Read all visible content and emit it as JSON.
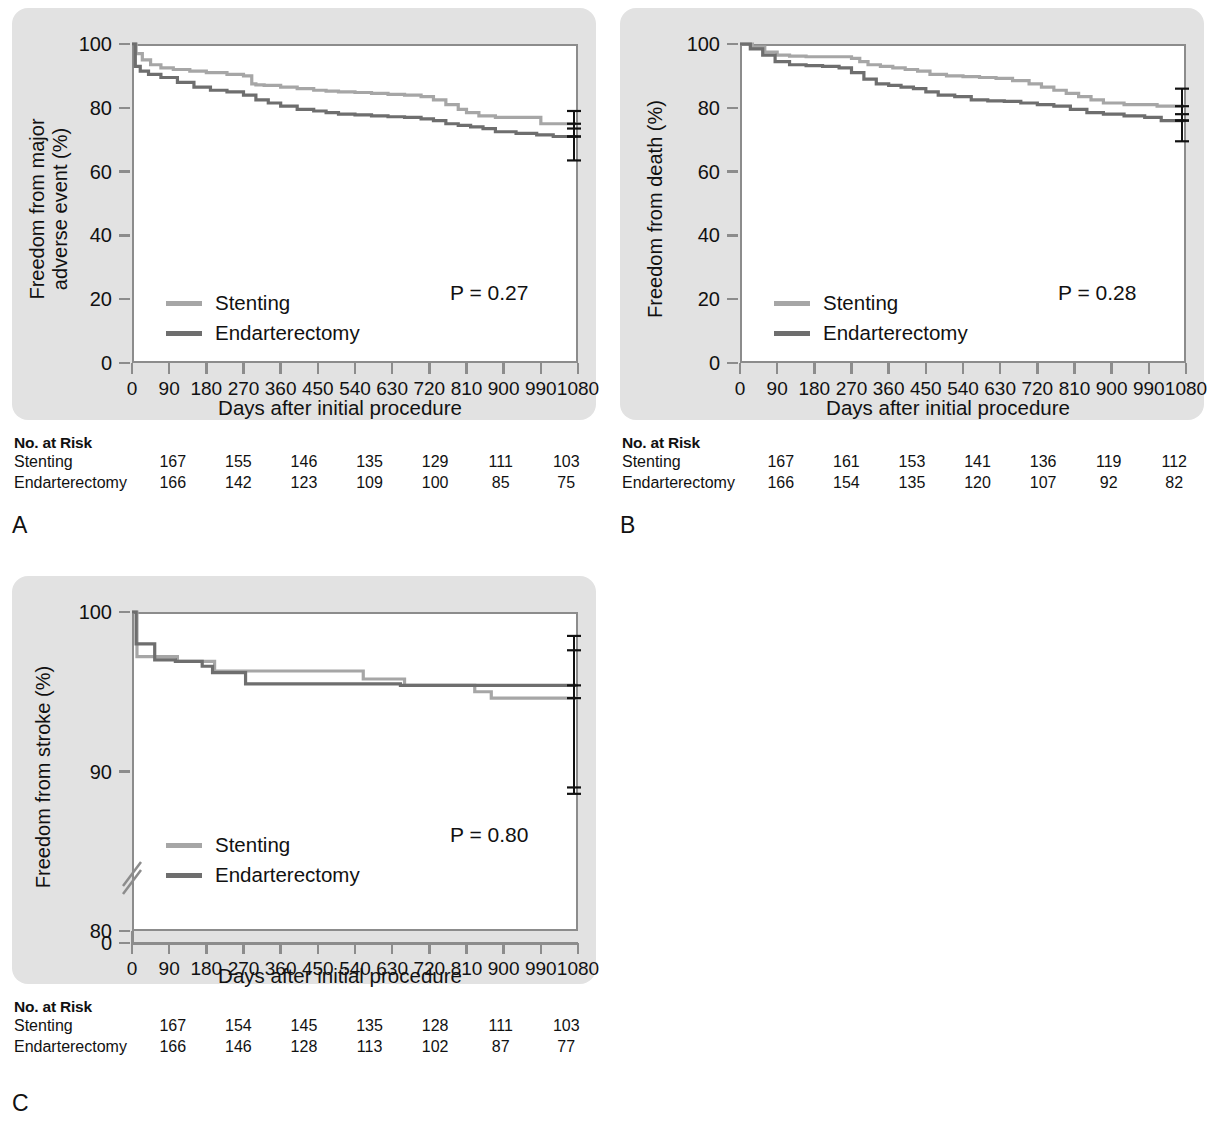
{
  "figure": {
    "style": {
      "plate_background": "#e2e2e2",
      "plot_background": "#ffffff",
      "axis_color": "#8c8c8c",
      "text_color": "#111111",
      "stenting_color": "#a6a6a6",
      "endarterectomy_color": "#6e6e6e",
      "errorbar_color": "#111111"
    },
    "panels": [
      {
        "id": "A",
        "letter": "A",
        "pvalue": "P = 0.27",
        "ylabel_line1": "Freedom from major",
        "ylabel_line2": "adverse event (%)",
        "xlabel": "Days after initial procedure",
        "legend": [
          {
            "label": "Stenting",
            "color": "#a6a6a6"
          },
          {
            "label": "Endarterectomy",
            "color": "#6e6e6e"
          }
        ],
        "yticks": [
          "0",
          "20",
          "40",
          "60",
          "80",
          "100"
        ],
        "xticks": [
          "0",
          "90",
          "180",
          "270",
          "360",
          "450",
          "540",
          "630",
          "720",
          "810",
          "900",
          "990",
          "1080"
        ],
        "risk": {
          "title": "No. at Risk",
          "rows": [
            {
              "name": "Stenting",
              "values": [
                "167",
                "155",
                "146",
                "135",
                "129",
                "111",
                "103"
              ]
            },
            {
              "name": "Endarterectomy",
              "values": [
                "166",
                "142",
                "123",
                "109",
                "100",
                "85",
                "75"
              ]
            }
          ]
        }
      },
      {
        "id": "B",
        "letter": "B",
        "pvalue": "P = 0.28",
        "ylabel_line1": "Freedom from death (%)",
        "ylabel_line2": "",
        "xlabel": "Days after initial procedure",
        "legend": [
          {
            "label": "Stenting",
            "color": "#a6a6a6"
          },
          {
            "label": "Endarterectomy",
            "color": "#6e6e6e"
          }
        ],
        "yticks": [
          "0",
          "20",
          "40",
          "60",
          "80",
          "100"
        ],
        "xticks": [
          "0",
          "90",
          "180",
          "270",
          "360",
          "450",
          "540",
          "630",
          "720",
          "810",
          "900",
          "990",
          "1080"
        ],
        "risk": {
          "title": "No. at Risk",
          "rows": [
            {
              "name": "Stenting",
              "values": [
                "167",
                "161",
                "153",
                "141",
                "136",
                "119",
                "112"
              ]
            },
            {
              "name": "Endarterectomy",
              "values": [
                "166",
                "154",
                "135",
                "120",
                "107",
                "92",
                "82"
              ]
            }
          ]
        }
      },
      {
        "id": "C",
        "letter": "C",
        "pvalue": "P = 0.80",
        "ylabel_line1": "Freedom from stroke (%)",
        "ylabel_line2": "",
        "xlabel": "Days after initial procedure",
        "legend": [
          {
            "label": "Stenting",
            "color": "#a6a6a6"
          },
          {
            "label": "Endarterectomy",
            "color": "#6e6e6e"
          }
        ],
        "yticks": [
          "0",
          "80",
          "90",
          "100"
        ],
        "xticks": [
          "0",
          "90",
          "180",
          "270",
          "360",
          "450",
          "540",
          "630",
          "720",
          "810",
          "900",
          "990",
          "1080"
        ],
        "axis_break": true,
        "risk": {
          "title": "No. at Risk",
          "rows": [
            {
              "name": "Stenting",
              "values": [
                "167",
                "154",
                "145",
                "135",
                "128",
                "111",
                "103"
              ]
            },
            {
              "name": "Endarterectomy",
              "values": [
                "166",
                "146",
                "128",
                "113",
                "102",
                "87",
                "77"
              ]
            }
          ]
        }
      }
    ]
  },
  "chart_data": [
    {
      "type": "line",
      "panel": "A",
      "title": "Freedom from major adverse event",
      "xlabel": "Days after initial procedure",
      "ylabel": "Freedom from major adverse event (%)",
      "xlim": [
        0,
        1080
      ],
      "ylim": [
        0,
        100
      ],
      "xticks": [
        0,
        90,
        180,
        270,
        360,
        450,
        540,
        630,
        720,
        810,
        900,
        990,
        1080
      ],
      "yticks": [
        0,
        20,
        40,
        60,
        80,
        100
      ],
      "grid": false,
      "legend_position": "lower-left",
      "annotations": [
        "P = 0.27"
      ],
      "pvalue": 0.27,
      "series": [
        {
          "name": "Stenting",
          "color": "#a6a6a6",
          "step": true,
          "x": [
            0,
            10,
            25,
            45,
            70,
            100,
            140,
            180,
            230,
            270,
            290,
            300,
            320,
            360,
            400,
            440,
            470,
            500,
            540,
            580,
            620,
            660,
            700,
            730,
            760,
            790,
            810,
            840,
            880,
            930,
            975,
            990,
            1020,
            1080
          ],
          "y": [
            100,
            97,
            95,
            93.5,
            92.5,
            92,
            91.5,
            91,
            90.5,
            90,
            87.5,
            87.2,
            87,
            86.5,
            86,
            85.5,
            85.2,
            85,
            84.8,
            84.5,
            84.2,
            84,
            83.5,
            82.5,
            81,
            79.5,
            78.5,
            77.5,
            77,
            77,
            77,
            75,
            75,
            75
          ]
        },
        {
          "name": "Endarterectomy",
          "color": "#6e6e6e",
          "step": true,
          "x": [
            0,
            8,
            20,
            40,
            70,
            110,
            150,
            190,
            230,
            270,
            300,
            330,
            360,
            400,
            440,
            470,
            500,
            540,
            580,
            620,
            660,
            700,
            730,
            760,
            790,
            820,
            850,
            880,
            930,
            980,
            1020,
            1080
          ],
          "y": [
            100,
            93,
            91.5,
            90.5,
            89.5,
            88,
            86.5,
            85.5,
            85,
            84,
            82.5,
            81.5,
            80.5,
            79.5,
            79,
            78.5,
            78,
            77.8,
            77.5,
            77.2,
            77,
            76.5,
            76,
            75,
            74.5,
            74,
            73.5,
            72.5,
            72,
            71.5,
            71,
            71
          ]
        }
      ],
      "errorbars": [
        {
          "series": "Stenting",
          "x": 1080,
          "value": 75,
          "low": 71,
          "high": 79
        },
        {
          "series": "Endarterectomy",
          "x": 1080,
          "value": 71,
          "low": 63.5,
          "high": 73.5
        }
      ],
      "risk_table": {
        "times": [
          0,
          180,
          360,
          540,
          720,
          900,
          1080
        ],
        "rows": [
          {
            "name": "Stenting",
            "values": [
              167,
              155,
              146,
              135,
              129,
              111,
              103
            ]
          },
          {
            "name": "Endarterectomy",
            "values": [
              166,
              142,
              123,
              109,
              100,
              85,
              75
            ]
          }
        ]
      }
    },
    {
      "type": "line",
      "panel": "B",
      "title": "Freedom from death",
      "xlabel": "Days after initial procedure",
      "ylabel": "Freedom from death (%)",
      "xlim": [
        0,
        1080
      ],
      "ylim": [
        0,
        100
      ],
      "xticks": [
        0,
        90,
        180,
        270,
        360,
        450,
        540,
        630,
        720,
        810,
        900,
        990,
        1080
      ],
      "yticks": [
        0,
        20,
        40,
        60,
        80,
        100
      ],
      "grid": false,
      "legend_position": "lower-left",
      "annotations": [
        "P = 0.28"
      ],
      "pvalue": 0.28,
      "series": [
        {
          "name": "Stenting",
          "color": "#a6a6a6",
          "step": true,
          "x": [
            0,
            30,
            60,
            90,
            120,
            160,
            200,
            250,
            270,
            290,
            310,
            340,
            370,
            400,
            430,
            460,
            500,
            540,
            580,
            620,
            660,
            700,
            730,
            760,
            790,
            820,
            850,
            880,
            930,
            980,
            1010,
            1080
          ],
          "y": [
            100,
            99,
            97.5,
            96.5,
            96.2,
            96,
            96,
            96,
            95.5,
            94.5,
            93.5,
            93,
            92.5,
            92,
            91.5,
            90.5,
            90,
            89.8,
            89.5,
            89.2,
            88.5,
            87.5,
            86.5,
            85.5,
            84.5,
            83.5,
            82.5,
            81.5,
            81,
            81,
            80.5,
            80.5
          ]
        },
        {
          "name": "Endarterectomy",
          "color": "#6e6e6e",
          "step": true,
          "x": [
            0,
            25,
            55,
            85,
            120,
            160,
            200,
            240,
            270,
            300,
            330,
            360,
            390,
            420,
            450,
            480,
            520,
            560,
            600,
            640,
            680,
            720,
            760,
            800,
            840,
            880,
            930,
            980,
            1020,
            1080
          ],
          "y": [
            100,
            98.5,
            96.5,
            94.5,
            93.5,
            93.2,
            93,
            92.5,
            91,
            89,
            87.5,
            87,
            86.5,
            86,
            85,
            84,
            83.5,
            82.5,
            82.2,
            82,
            81.5,
            81,
            80.5,
            79.5,
            78.5,
            78,
            77.5,
            77,
            76,
            76
          ]
        }
      ],
      "errorbars": [
        {
          "series": "Stenting",
          "x": 1080,
          "value": 80.5,
          "low": 76,
          "high": 86
        },
        {
          "series": "Endarterectomy",
          "x": 1080,
          "value": 76,
          "low": 69.5,
          "high": 78
        }
      ],
      "risk_table": {
        "times": [
          0,
          180,
          360,
          540,
          720,
          900,
          1080
        ],
        "rows": [
          {
            "name": "Stenting",
            "values": [
              167,
              161,
              153,
              141,
              136,
              119,
              112
            ]
          },
          {
            "name": "Endarterectomy",
            "values": [
              166,
              154,
              135,
              120,
              107,
              92,
              82
            ]
          }
        ]
      }
    },
    {
      "type": "line",
      "panel": "C",
      "title": "Freedom from stroke",
      "xlabel": "Days after initial procedure",
      "ylabel": "Freedom from stroke (%)",
      "xlim": [
        0,
        1080
      ],
      "ylim": [
        80,
        100
      ],
      "y_axis_broken": true,
      "y_break_between": [
        0,
        80
      ],
      "xticks": [
        0,
        90,
        180,
        270,
        360,
        450,
        540,
        630,
        720,
        810,
        900,
        990,
        1080
      ],
      "yticks": [
        0,
        80,
        90,
        100
      ],
      "grid": false,
      "legend_position": "lower-left",
      "annotations": [
        "P = 0.80"
      ],
      "pvalue": 0.8,
      "series": [
        {
          "name": "Stenting",
          "color": "#a6a6a6",
          "step": true,
          "x": [
            0,
            12,
            60,
            110,
            175,
            200,
            265,
            540,
            560,
            640,
            660,
            690,
            810,
            830,
            870,
            1080
          ],
          "y": [
            100,
            97.2,
            97.2,
            96.9,
            96.9,
            96.3,
            96.3,
            96.3,
            95.8,
            95.8,
            95.4,
            95.4,
            95.4,
            95.0,
            94.6,
            94.6
          ]
        },
        {
          "name": "Endarterectomy",
          "color": "#6e6e6e",
          "step": true,
          "x": [
            0,
            10,
            55,
            105,
            170,
            195,
            260,
            275,
            630,
            650,
            690,
            810,
            1080
          ],
          "y": [
            100,
            98.0,
            97.0,
            96.9,
            96.6,
            96.2,
            96.2,
            95.5,
            95.5,
            95.4,
            95.4,
            95.4,
            95.4
          ]
        }
      ],
      "errorbars": [
        {
          "series": "Stenting",
          "x": 1080,
          "value": 94.6,
          "low": 89.0,
          "high": 98.5
        },
        {
          "series": "Endarterectomy",
          "x": 1080,
          "value": 95.4,
          "low": 88.6,
          "high": 97.6
        }
      ],
      "risk_table": {
        "times": [
          0,
          180,
          360,
          540,
          720,
          900,
          1080
        ],
        "rows": [
          {
            "name": "Stenting",
            "values": [
              167,
              154,
              145,
              135,
              128,
              111,
              103
            ]
          },
          {
            "name": "Endarterectomy",
            "values": [
              166,
              146,
              128,
              113,
              102,
              87,
              77
            ]
          }
        ]
      }
    }
  ]
}
